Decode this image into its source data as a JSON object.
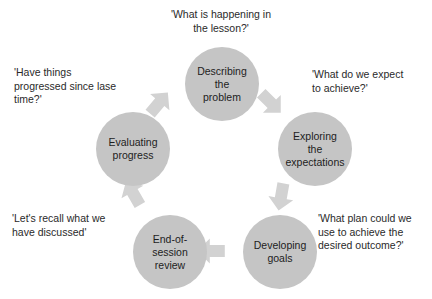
{
  "diagram": {
    "type": "cyclical-process-diagram",
    "direction": "clockwise",
    "colors": {
      "node_fill": "#c5c5c5",
      "arrow_fill": "#d2d2d2",
      "text": "#1d1d1d",
      "background": "#ffffff"
    },
    "nodes": [
      {
        "id": "describing",
        "label": "Describing\nthe\nproblem"
      },
      {
        "id": "exploring",
        "label": "Exploring\nthe\nexpectations"
      },
      {
        "id": "developing",
        "label": "Developing\ngoals"
      },
      {
        "id": "end-of-session",
        "label": "End-of-\nsession\nreview"
      },
      {
        "id": "evaluating",
        "label": "Evaluating\nprogress"
      }
    ],
    "captions": [
      {
        "id": "top",
        "text": "'What is happening in\nthe lesson?'"
      },
      {
        "id": "left",
        "text": "'Have things\nprogressed since lase\ntime?'"
      },
      {
        "id": "right",
        "text": "'What do we expect\nto achieve?'"
      },
      {
        "id": "bot-right",
        "text": "'What plan could we\nuse to achieve the\ndesired outcome?'"
      },
      {
        "id": "bot-left",
        "text": "'Let's recall what we\nhave discussed'"
      }
    ],
    "arrows": [
      {
        "id": "evaluating-to-describing",
        "from": "evaluating",
        "to": "describing"
      },
      {
        "id": "describing-to-exploring",
        "from": "describing",
        "to": "exploring"
      },
      {
        "id": "exploring-to-developing",
        "from": "exploring",
        "to": "developing"
      },
      {
        "id": "developing-to-end",
        "from": "developing",
        "to": "end-of-session"
      },
      {
        "id": "end-to-evaluating",
        "from": "end-of-session",
        "to": "evaluating"
      }
    ]
  }
}
